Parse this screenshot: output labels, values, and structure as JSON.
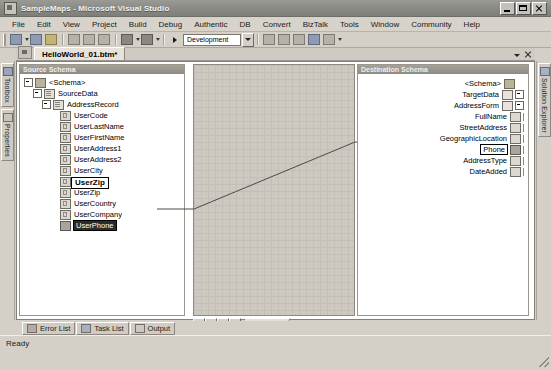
{
  "window": {
    "title": "SampleMaps - Microsoft Visual Studio",
    "app_icon": "visual-studio-icon",
    "minimize_label": "Minimize",
    "maximize_label": "Maximize",
    "close_label": "Close"
  },
  "menubar": {
    "items": [
      {
        "label": "File"
      },
      {
        "label": "Edit"
      },
      {
        "label": "View"
      },
      {
        "label": "Project"
      },
      {
        "label": "Build"
      },
      {
        "label": "Debug"
      },
      {
        "label": "Authentic"
      },
      {
        "label": "DB"
      },
      {
        "label": "Convert"
      },
      {
        "label": "BizTalk"
      },
      {
        "label": "Tools"
      },
      {
        "label": "Window"
      },
      {
        "label": "Community"
      },
      {
        "label": "Help"
      }
    ]
  },
  "toolbar": {
    "buttons": [
      {
        "name": "new-project-icon",
        "style": "blue"
      },
      {
        "name": "save-icon",
        "style": "blue"
      },
      {
        "name": "save-all-icon",
        "style": "yel"
      },
      {
        "name": "cut-icon",
        "style": "gray"
      },
      {
        "name": "copy-icon",
        "style": "gray"
      },
      {
        "name": "paste-icon",
        "style": "gray"
      },
      {
        "name": "undo-icon",
        "style": "dk"
      },
      {
        "name": "redo-icon",
        "style": "dk"
      },
      {
        "name": "start-debug-icon",
        "style": "gray"
      }
    ],
    "config_value": "Development",
    "right_buttons": [
      {
        "name": "find-icon",
        "style": "gray"
      },
      {
        "name": "solution-explorer-icon",
        "style": "gray"
      },
      {
        "name": "properties-window-icon",
        "style": "gray"
      },
      {
        "name": "object-browser-icon",
        "style": "blue"
      },
      {
        "name": "toolbox-icon",
        "style": "gray"
      }
    ]
  },
  "doctabs": {
    "active_tab": "HelloWorld_01.btm*",
    "dropdown_label": "Active Files",
    "close_label": "Close"
  },
  "docks": {
    "left": [
      {
        "label": "Toolbox",
        "icon": "toolbox-icon"
      },
      {
        "label": "Properties",
        "icon": "properties-icon"
      }
    ],
    "right": [
      {
        "label": "Solution Explorer",
        "icon": "solution-explorer-icon"
      }
    ]
  },
  "source_pane": {
    "title": "Source Schema",
    "nodes": [
      {
        "label": "<Schema>",
        "indent": 0,
        "icon": "folder",
        "expander": true
      },
      {
        "label": "SourceData",
        "indent": 1,
        "icon": "doc",
        "expander": true
      },
      {
        "label": "AddressRecord",
        "indent": 2,
        "icon": "doc",
        "expander": true
      },
      {
        "label": "UserCode",
        "indent": 3,
        "icon": "leaf",
        "expander": false
      },
      {
        "label": "UserLastName",
        "indent": 3,
        "icon": "leaf",
        "expander": false
      },
      {
        "label": "UserFirstName",
        "indent": 3,
        "icon": "leaf",
        "expander": false
      },
      {
        "label": "UserAddress1",
        "indent": 3,
        "icon": "leaf",
        "expander": false
      },
      {
        "label": "UserAddress2",
        "indent": 3,
        "icon": "leaf",
        "expander": false
      },
      {
        "label": "UserCity",
        "indent": 3,
        "icon": "leaf",
        "expander": false
      },
      {
        "label": "UserState",
        "indent": 3,
        "icon": "leaf",
        "expander": false
      },
      {
        "label": "UserZip",
        "indent": 3,
        "icon": "leaf",
        "expander": false
      },
      {
        "label": "UserCountry",
        "indent": 3,
        "icon": "leaf",
        "expander": false
      },
      {
        "label": "UserCompany",
        "indent": 3,
        "icon": "leaf",
        "expander": false
      },
      {
        "label": "UserPhone",
        "indent": 3,
        "icon": "phone",
        "expander": false,
        "selected": true
      }
    ],
    "tooltip": "UserZip"
  },
  "destination_pane": {
    "title": "Destination Schema",
    "nodes": [
      {
        "label": "<Schema>",
        "icon": "folder",
        "expander": false,
        "rail": false
      },
      {
        "label": "TargetData",
        "icon": "doc",
        "expander": true,
        "rail": false
      },
      {
        "label": "AddressForm",
        "icon": "doc",
        "expander": true,
        "rail": false
      },
      {
        "label": "FullName",
        "icon": "leaf",
        "expander": false,
        "rail": true
      },
      {
        "label": "StreetAddress",
        "icon": "leaf",
        "expander": false,
        "rail": true
      },
      {
        "label": "GeographicLocation",
        "icon": "leaf",
        "expander": false,
        "rail": true
      },
      {
        "label": "Phone",
        "icon": "sel",
        "expander": false,
        "rail": true,
        "selected": true
      },
      {
        "label": "AddressType",
        "icon": "leaf",
        "expander": false,
        "rail": true
      },
      {
        "label": "DateAdded",
        "icon": "leaf",
        "expander": false,
        "rail": true
      }
    ]
  },
  "canvas": {
    "page_label": "Page 1",
    "nav": [
      {
        "name": "first-page-button",
        "glyph": "first"
      },
      {
        "name": "previous-page-button",
        "glyph": "prev"
      },
      {
        "name": "next-page-button",
        "glyph": "next"
      },
      {
        "name": "last-page-button",
        "glyph": "last"
      }
    ],
    "link": {
      "from": "UserPhone",
      "to": "Phone",
      "color": "#4a4a46"
    }
  },
  "bottom_tabs": [
    {
      "label": "Error List",
      "icon": "error-list-icon",
      "style": "err"
    },
    {
      "label": "Task List",
      "icon": "task-list-icon",
      "style": "task"
    },
    {
      "label": "Output",
      "icon": "output-icon",
      "style": "out"
    }
  ],
  "statusbar": {
    "text": "Ready"
  }
}
